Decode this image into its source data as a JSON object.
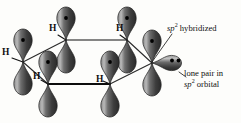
{
  "figure": {
    "background_color": "#fdfdfb",
    "lobe_fill_dark": "#3a3a3a",
    "lobe_fill_light": "#cfcfcf",
    "bond_color": "#111111",
    "electron_dot_color": "#000000"
  },
  "atom_labels": [
    {
      "id": "h-left",
      "text": "H",
      "x": 3,
      "y": 54
    },
    {
      "id": "h-upper-left",
      "text": "H",
      "x": 50,
      "y": 28
    },
    {
      "id": "h-upper-right",
      "text": "H",
      "x": 116,
      "y": 28
    },
    {
      "id": "h-lower-left",
      "text": "H",
      "x": 34,
      "y": 75
    },
    {
      "id": "h-lower-right",
      "text": "H",
      "x": 97,
      "y": 78
    }
  ],
  "annotations": [
    {
      "id": "sp2-hybridized",
      "lines": [
        "sp2 hybridized"
      ],
      "prefix_italic": "sp",
      "superscript": "2",
      "suffix": " hybridized",
      "x": 167,
      "y": 26
    },
    {
      "id": "lone-pair",
      "line1": "lone pair in",
      "prefix_italic": "sp",
      "superscript": "2",
      "suffix": " orbital",
      "x": 184,
      "y": 72
    }
  ],
  "orbitals": {
    "count_p_lobe_pairs": 6,
    "lone_pair_lobe": {
      "orientation": "right",
      "electron_dots": 2
    },
    "electron_dots_per_upper_lobe": 1
  },
  "ring": {
    "vertices": [
      {
        "id": "v-upper-left",
        "x": 66,
        "y": 40
      },
      {
        "id": "v-upper-right",
        "x": 127,
        "y": 40
      },
      {
        "id": "v-right",
        "x": 152,
        "y": 63
      },
      {
        "id": "v-lower-right",
        "x": 110,
        "y": 84
      },
      {
        "id": "v-lower-left",
        "x": 48,
        "y": 84
      },
      {
        "id": "v-left",
        "x": 23,
        "y": 62
      }
    ]
  }
}
